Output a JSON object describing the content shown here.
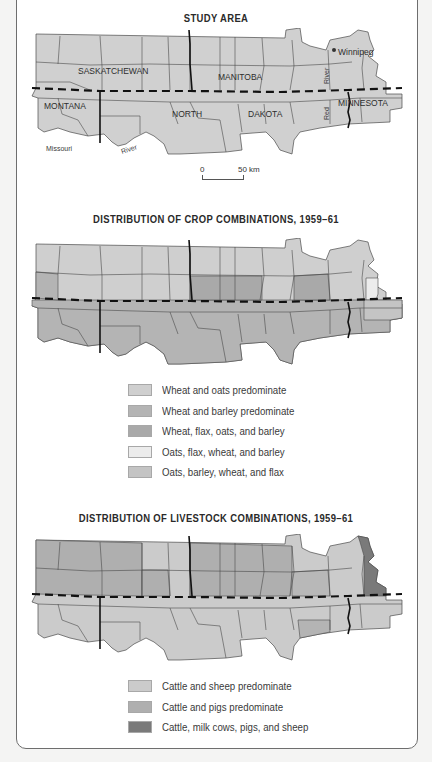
{
  "study_area": {
    "title": "STUDY AREA",
    "labels": {
      "saskatchewan": "SASKATCHEWAN",
      "manitoba": "MANITOBA",
      "montana": "MONTANA",
      "north": "NORTH",
      "dakota": "DAKOTA",
      "minnesota": "MINNESOTA",
      "winnipeg": "Winnipeg",
      "missouri": "Missouri",
      "river_missouri": "River",
      "river_red_1": "River",
      "red": "Red"
    },
    "scale": {
      "zero": "0",
      "end": "50 km"
    }
  },
  "crop_map": {
    "title": "DISTRIBUTION OF CROP COMBINATIONS, 1959–61",
    "legend": [
      {
        "label": "Wheat and oats predominate",
        "color": "#cfcfcf"
      },
      {
        "label": "Wheat and barley predominate",
        "color": "#b4b4b4"
      },
      {
        "label": "Wheat, flax, oats, and barley",
        "color": "#a9a9a9"
      },
      {
        "label": "Oats, flax, wheat, and barley",
        "color": "#ececec"
      },
      {
        "label": "Oats, barley, wheat, and flax",
        "color": "#c4c4c4"
      }
    ]
  },
  "livestock_map": {
    "title": "DISTRIBUTION OF LIVESTOCK COMBINATIONS, 1959–61",
    "legend": [
      {
        "label": "Cattle and sheep predominate",
        "color": "#cbcbcb"
      },
      {
        "label": "Cattle and pigs predominate",
        "color": "#afafaf"
      },
      {
        "label": "Cattle, milk cows, pigs, and sheep",
        "color": "#7a7a7a"
      }
    ]
  },
  "colors": {
    "background": "#f4f4f3",
    "frame_border": "#6e6e6e",
    "study_fill": "#d0d0d0",
    "boundary_line": "#111111"
  }
}
